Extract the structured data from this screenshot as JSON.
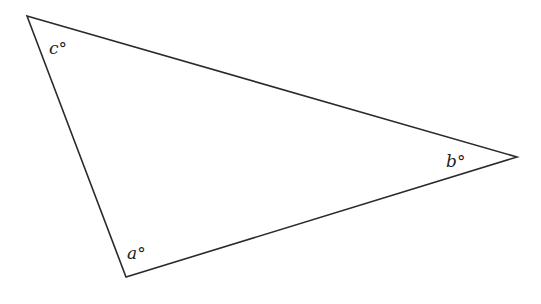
{
  "diagram": {
    "type": "triangle",
    "stroke_color": "#2a2a2a",
    "vertices": {
      "top_left": [
        27,
        16
      ],
      "right": [
        517,
        157
      ],
      "bottom": [
        126,
        277
      ]
    },
    "angle_labels": {
      "c": "c°",
      "b": "b°",
      "a": "a°"
    }
  }
}
